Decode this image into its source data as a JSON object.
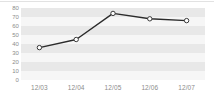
{
  "chart_data": {
    "type": "line",
    "title": "",
    "subtitle": "",
    "xlabel": "",
    "ylabel": "",
    "categories": [
      "12/03",
      "12/04",
      "12/05",
      "12/06",
      "12/07"
    ],
    "values": [
      36,
      45,
      74,
      68,
      66
    ],
    "series": [
      {
        "name": "series-1",
        "values": [
          36,
          45,
          74,
          68,
          66
        ]
      }
    ],
    "ylim": [
      0,
      80
    ],
    "ytick_step": 10,
    "yticks": [
      0,
      10,
      20,
      30,
      40,
      50,
      60,
      70,
      80
    ],
    "ytick_labels": [
      "0",
      "10",
      "20",
      "30",
      "40",
      "50",
      "60",
      "70",
      "80"
    ],
    "grid": "horizontal-bands",
    "legend": "none",
    "colors": {
      "line": "#2b2b2b",
      "marker_fill": "#ffffff",
      "marker_edge": "#3a3a3a",
      "band": "#e8e8e8",
      "plot_background": "#ffffff",
      "tick_label": "#8c8c8c",
      "top_rule": "#e2e2e2"
    }
  }
}
